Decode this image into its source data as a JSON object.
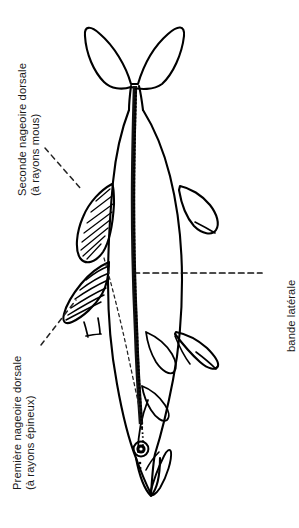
{
  "diagram": {
    "orientation": "fish rotated 90 degrees, head at bottom, tail at top",
    "background_color": "#ffffff",
    "ink_color": "#000000",
    "text_color": "#1a1a1a"
  },
  "labels": {
    "second_dorsal": {
      "line1": "Seconde nageoire dorsale",
      "line2": "(à rayons mous)"
    },
    "first_dorsal": {
      "line1": "Première nageoire dorsale",
      "line2": "(à rayons épineux)"
    },
    "lateral_band": {
      "line1": "bande latérale"
    }
  },
  "parts": {
    "caudal_fin": "caudal-fin",
    "second_dorsal_fin": "second-dorsal-fin",
    "first_dorsal_fin": "first-dorsal-fin",
    "anal_fin": "anal-fin",
    "pelvic_fin": "pelvic-fin",
    "pectoral_fin": "pectoral-fin",
    "body": "fish-body",
    "head": "fish-head",
    "eye": "fish-eye",
    "mouth": "fish-mouth",
    "dark_stripe": "dark-dorsal-stripe",
    "lateral_line": "lateral-line-dashed"
  }
}
